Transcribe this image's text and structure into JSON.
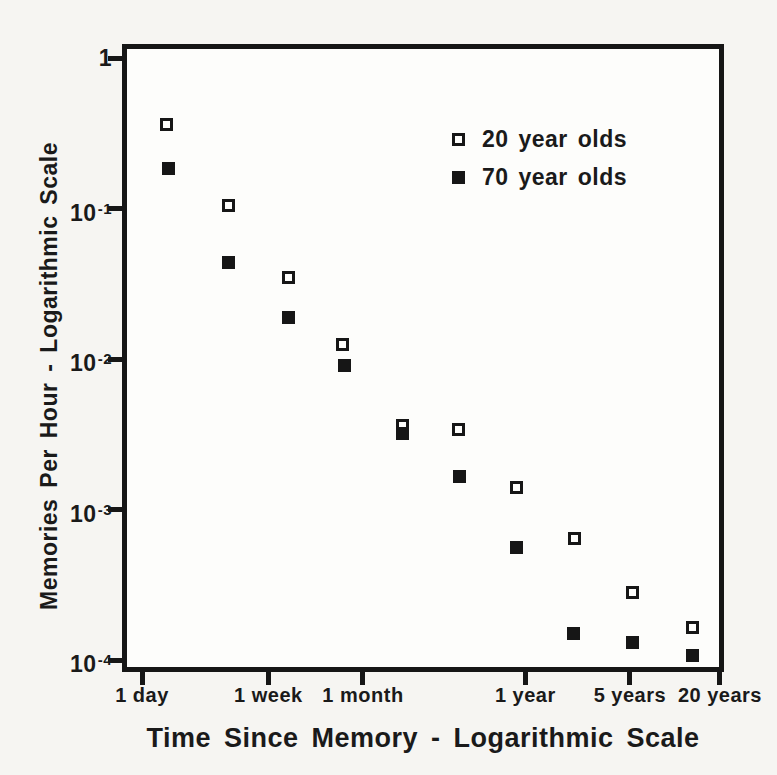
{
  "figure": {
    "x_axis_title": "Time Since Memory - Logarithmic Scale",
    "y_axis_title": "Memories Per Hour - Logarithmic Scale"
  },
  "legend": {
    "items": [
      {
        "label": "20 year olds",
        "marker": "open-square"
      },
      {
        "label": "70 year olds",
        "marker": "filled-square"
      }
    ]
  },
  "colors": {
    "ink": "#161616",
    "paper": "#f6f5f2",
    "plot_background": "#fdfdfb"
  },
  "chart_data": {
    "type": "scatter",
    "title": "",
    "xlabel": "Time Since Memory - Logarithmic Scale",
    "ylabel": "Memories Per Hour - Logarithmic Scale",
    "x_scale": "log",
    "y_scale": "log",
    "x_unit": "days",
    "xlim_days": [
      0.76,
      7650
    ],
    "ylim": [
      8.8e-05,
      1.2
    ],
    "grid": false,
    "legend_position": "upper-right-inside",
    "x_ticks": [
      {
        "label": "1 day",
        "days": 1
      },
      {
        "label": "1 week",
        "days": 7
      },
      {
        "label": "1 month",
        "days": 30
      },
      {
        "label": "1 year",
        "days": 365
      },
      {
        "label": "5 years",
        "days": 1825
      },
      {
        "label": "20 years",
        "days": 7300
      }
    ],
    "y_ticks": [
      {
        "base": "1",
        "sup": "",
        "value": 1
      },
      {
        "base": "10",
        "sup": "-1",
        "value": 0.1
      },
      {
        "base": "10",
        "sup": "-2",
        "value": 0.01
      },
      {
        "base": "10",
        "sup": "-3",
        "value": 0.001
      },
      {
        "base": "10",
        "sup": "-4",
        "value": 0.0001
      }
    ],
    "series": [
      {
        "name": "20 year olds",
        "marker": "open-square",
        "points_days_vs_memories_per_hour": [
          [
            1.45,
            0.36
          ],
          [
            3.8,
            0.105
          ],
          [
            9.6,
            0.035
          ],
          [
            22,
            0.0125
          ],
          [
            55,
            0.0036
          ],
          [
            131,
            0.0034
          ],
          [
            320,
            0.0014
          ],
          [
            775,
            0.00064
          ],
          [
            1900,
            0.00028
          ],
          [
            4800,
            0.000165
          ]
        ]
      },
      {
        "name": "70 year olds",
        "marker": "filled-square",
        "points_days_vs_memories_per_hour": [
          [
            1.5,
            0.185
          ],
          [
            3.8,
            0.044
          ],
          [
            9.6,
            0.019
          ],
          [
            22.5,
            0.009
          ],
          [
            55,
            0.0032
          ],
          [
            133,
            0.00165
          ],
          [
            318,
            0.00056
          ],
          [
            765,
            0.00015
          ],
          [
            1900,
            0.00013
          ],
          [
            4800,
            0.000107
          ]
        ]
      }
    ]
  }
}
